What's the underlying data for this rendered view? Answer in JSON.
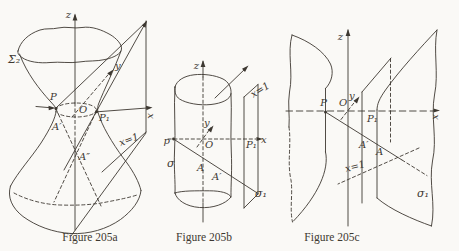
{
  "page": {
    "background": "#faf9f6",
    "ink": "#3d3831"
  },
  "figure_a": {
    "caption": "Figure 205a",
    "labels": {
      "surface": "Σ₂",
      "z": "z",
      "y": "y",
      "x": "x",
      "P": "P",
      "O": "O",
      "P1": "P₁",
      "A_prime": "A′",
      "A_dprime": "A″",
      "plane": "x=1"
    }
  },
  "figure_b": {
    "caption": "Figure 205b",
    "labels": {
      "surface": "σ",
      "z": "z",
      "y": "y",
      "x": "x",
      "P": "p",
      "O": "O",
      "P1": "P₁",
      "A": "A",
      "A_prime": "A′",
      "plane": "x=1"
    }
  },
  "figure_c": {
    "caption": "Figure 205c",
    "labels": {
      "surface_left": "σ₁",
      "surface_right": "σ₁",
      "z": "z",
      "y": "y",
      "x": "x",
      "P": "P",
      "O": "O",
      "P1": "P₁",
      "A": "A",
      "A_prime": "A′",
      "plane": "x=1"
    }
  }
}
